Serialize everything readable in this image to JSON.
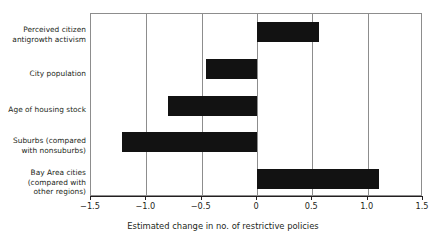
{
  "chart_data": {
    "type": "bar",
    "orientation": "horizontal",
    "title": "",
    "xlabel": "Estimated change in no. of restrictive policies",
    "ylabel": "",
    "xlim": [
      -1.5,
      1.5
    ],
    "xticks": [
      -1.5,
      -1.0,
      -0.5,
      0,
      0.5,
      1.0,
      1.5
    ],
    "xtick_labels": [
      "−1.5",
      "−1.0",
      "−0.5",
      "0",
      "0.5",
      "1.0",
      "1.5"
    ],
    "grid": true,
    "grid_axis": "x",
    "legend": null,
    "bar_color": "#121212",
    "axis_color": "#8d8d8d",
    "text_color": "#231f20",
    "categories": [
      "Perceived citizen antigrowth activism",
      "City population",
      "Age of housing stock",
      "Suburbs (compared with nonsuburbs)",
      "Bay Area cities (compared with other regions)"
    ],
    "category_label_lines": [
      [
        "Perceived citizen",
        "antigrowth activism"
      ],
      [
        "City population"
      ],
      [
        "Age of housing stock"
      ],
      [
        "Suburbs (compared",
        "with nonsuburbs)"
      ],
      [
        "Bay Area cities",
        "(compared with",
        "other regions)"
      ]
    ],
    "values": [
      0.56,
      -0.46,
      -0.8,
      -1.22,
      1.1
    ]
  }
}
